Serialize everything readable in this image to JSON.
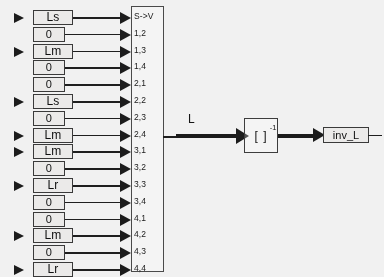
{
  "diagram": {
    "background_color": "#f2f1ef",
    "line_color": "#1c1c1c"
  },
  "matrix_rows": [
    {
      "label": "Ls",
      "type": "named",
      "has_input": true,
      "port": "S->V"
    },
    {
      "label": "0",
      "type": "zero",
      "has_input": false,
      "port": "1,2"
    },
    {
      "label": "Lm",
      "type": "named",
      "has_input": true,
      "port": "1,3"
    },
    {
      "label": "0",
      "type": "zero",
      "has_input": false,
      "port": "1,4"
    },
    {
      "label": "0",
      "type": "zero",
      "has_input": false,
      "port": "2,1"
    },
    {
      "label": "Ls",
      "type": "named",
      "has_input": true,
      "port": "2,2"
    },
    {
      "label": "0",
      "type": "zero",
      "has_input": false,
      "port": "2,3"
    },
    {
      "label": "Lm",
      "type": "named",
      "has_input": true,
      "port": "2,4"
    },
    {
      "label": "Lm",
      "type": "named",
      "has_input": true,
      "port": "3,1"
    },
    {
      "label": "0",
      "type": "zero",
      "has_input": false,
      "port": "3,2"
    },
    {
      "label": "Lr",
      "type": "named",
      "has_input": true,
      "port": "3,3"
    },
    {
      "label": "0",
      "type": "zero",
      "has_input": false,
      "port": "3,4"
    },
    {
      "label": "0",
      "type": "zero",
      "has_input": false,
      "port": "4,1"
    },
    {
      "label": "Lm",
      "type": "named",
      "has_input": true,
      "port": "4,2"
    },
    {
      "label": "0",
      "type": "zero",
      "has_input": false,
      "port": "4,3"
    },
    {
      "label": "Lr",
      "type": "named",
      "has_input": true,
      "port": "4,4"
    }
  ],
  "mux": {
    "name": "S->V",
    "first_port_label": "S->V",
    "port_count": 16
  },
  "signals": {
    "matrix_signal_label": "L"
  },
  "inverse_block": {
    "base_label": "[ ]",
    "exponent_label": "-1"
  },
  "output_block": {
    "label": "inv_L"
  }
}
